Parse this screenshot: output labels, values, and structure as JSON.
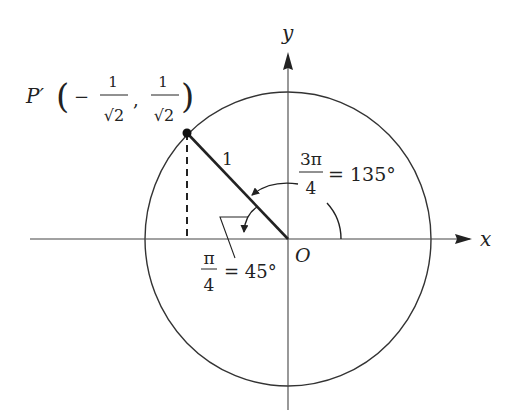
{
  "diagram": {
    "type": "unit-circle",
    "colors": {
      "stroke": "#333333",
      "background": "#ffffff"
    },
    "axes": {
      "x_label": "x",
      "y_label": "y",
      "origin_label": "O"
    },
    "point": {
      "name": "P′",
      "coord_x_sign": "−",
      "coord_num": "1",
      "coord_den": "√2",
      "separator": ",",
      "open_paren": "(",
      "close_paren": ")"
    },
    "radius_label": "1",
    "angle_big": {
      "num": "3π",
      "den": "4",
      "eq": "= 135°"
    },
    "angle_small": {
      "num": "π",
      "den": "4",
      "eq": "= 45°"
    }
  }
}
